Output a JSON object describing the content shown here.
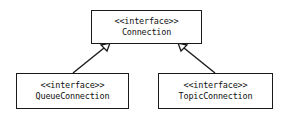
{
  "diagram": {
    "type": "uml-class-inheritance",
    "nodes": [
      {
        "id": "connection",
        "stereotype": "<<interface>>",
        "name": "Connection"
      },
      {
        "id": "queue",
        "stereotype": "<<interface>>",
        "name": "QueueConnection"
      },
      {
        "id": "topic",
        "stereotype": "<<interface>>",
        "name": "TopicConnection"
      }
    ],
    "edges": [
      {
        "from": "queue",
        "to": "connection",
        "kind": "generalization"
      },
      {
        "from": "topic",
        "to": "connection",
        "kind": "generalization"
      }
    ]
  }
}
